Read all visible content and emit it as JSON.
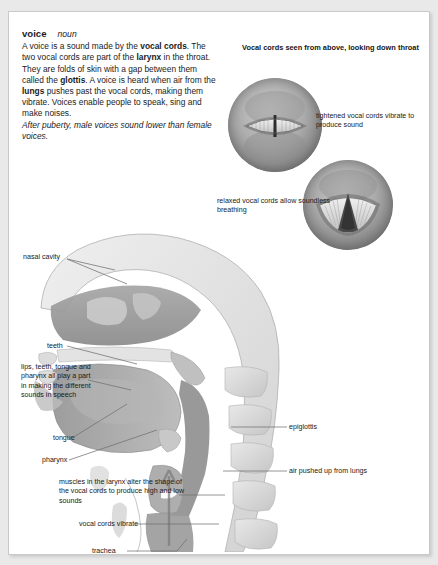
{
  "definition": {
    "headword": "voice",
    "part_of_speech": "noun",
    "body_segments": [
      {
        "text": "A voice is a sound made by the ",
        "bold": false
      },
      {
        "text": "vocal cords",
        "bold": true
      },
      {
        "text": ". The two vocal cords are part of the ",
        "bold": false
      },
      {
        "text": "larynx",
        "bold": true
      },
      {
        "text": " in the throat. They are folds of skin with a gap between them called the ",
        "bold": false
      },
      {
        "text": "glottis",
        "bold": true
      },
      {
        "text": ". A voice is heard when air from the ",
        "bold": false
      },
      {
        "text": "lungs",
        "bold": true
      },
      {
        "text": " pushes past the vocal cords, making them vibrate. Voices enable people to speak, sing and make noises.",
        "bold": false
      }
    ],
    "italic_note": "After puberty, male voices sound lower than female voices."
  },
  "insets": {
    "heading": "Vocal cords seen from above, looking down throat",
    "top_label": "tightened vocal cords vibrate to produce sound",
    "bottom_label": "relaxed vocal cords allow soundless breathing"
  },
  "figure_labels": {
    "nasal_cavity": "nasal cavity",
    "teeth": "teeth",
    "lips_block": "lips, teeth, tongue and pharynx all play a part in making the different sounds in speech",
    "tongue": "tongue",
    "pharynx": "pharynx",
    "epiglottis": "epiglottis",
    "air_from_lungs": "air pushed up from lungs",
    "muscles": "muscles in the larynx alter the shape of the vocal cords to produce high and low sounds",
    "vocal_cords_vibrate": "vocal cords vibrate",
    "trachea": "trachea"
  },
  "colors": {
    "page_background": "#ffffff",
    "outer_background": "#e9e9e9",
    "text": "#1a1a1a",
    "leader_line": "#6f6f6f",
    "anatomy_dark": "#8d8d8d",
    "anatomy_mid": "#b4b4b4",
    "anatomy_light": "#dcdcdc"
  }
}
